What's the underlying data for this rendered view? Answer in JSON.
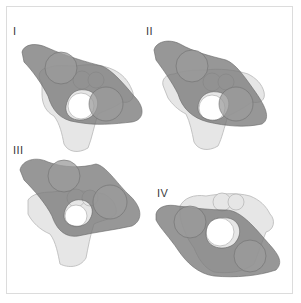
{
  "figure": {
    "panels": [
      {
        "id": "I",
        "label": "I"
      },
      {
        "id": "II",
        "label": "II"
      },
      {
        "id": "III",
        "label": "III"
      },
      {
        "id": "IV",
        "label": "IV"
      }
    ],
    "colors": {
      "frame_border": "#dcdcdc",
      "vertebra_fill": "#e6e6e6",
      "vertebra_stroke": "#b8b8b8",
      "overlay_fill": "#7a7a7a",
      "overlay_opacity": "0.8",
      "joint_fill": "#9b9b9b",
      "label_color": "#3a3a3a"
    }
  }
}
